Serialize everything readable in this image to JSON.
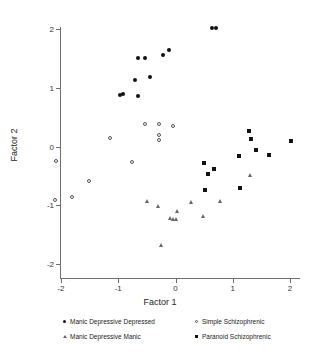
{
  "chart_data": {
    "type": "scatter",
    "title": "",
    "xlabel": "Factor 1",
    "ylabel": "Factor 2",
    "xlim": [
      -2.2,
      2.2
    ],
    "ylim": [
      -2.2,
      2.2
    ],
    "xticks": [
      "-2",
      "-1",
      "0",
      "1",
      "2"
    ],
    "xtick_values": [
      -2,
      -1,
      0,
      1,
      2
    ],
    "yticks": [
      "-2",
      "-1",
      "0",
      "1",
      "2"
    ],
    "ytick_values": [
      -2,
      -1,
      0,
      1,
      2
    ],
    "grid": false,
    "legend_position": "below",
    "series": [
      {
        "name": "Manic Depressive Depressed",
        "marker": "filled-circle",
        "color": "#111111",
        "points": [
          [
            -0.97,
            0.88
          ],
          [
            -0.92,
            0.9
          ],
          [
            -0.7,
            1.13
          ],
          [
            -0.66,
            0.86
          ],
          [
            -0.66,
            1.5
          ],
          [
            -0.53,
            1.5
          ],
          [
            -0.44,
            1.19
          ],
          [
            -0.21,
            1.55
          ],
          [
            -0.11,
            1.64
          ],
          [
            0.64,
            2.01
          ],
          [
            0.71,
            2.01
          ]
        ]
      },
      {
        "name": "Manic Depressive Manic",
        "marker": "open-triangle",
        "color": "#666666",
        "points": [
          [
            -0.5,
            -0.93
          ],
          [
            -0.3,
            -1.01
          ],
          [
            -0.09,
            -1.21
          ],
          [
            -0.05,
            -1.23
          ],
          [
            0.0,
            -1.23
          ],
          [
            0.02,
            -1.09
          ],
          [
            0.27,
            -0.94
          ],
          [
            0.48,
            -1.19
          ],
          [
            0.78,
            -0.92
          ],
          [
            1.3,
            -0.48
          ],
          [
            -0.25,
            -1.67
          ]
        ]
      },
      {
        "name": "Simple Schizophrenic",
        "marker": "open-circle",
        "color": "#555555",
        "points": [
          [
            -2.09,
            -0.25
          ],
          [
            -2.1,
            -0.91
          ],
          [
            -1.81,
            -0.86
          ],
          [
            -1.51,
            -0.58
          ],
          [
            -1.15,
            0.14
          ],
          [
            -0.76,
            -0.26
          ],
          [
            -0.54,
            0.39
          ],
          [
            -0.29,
            0.39
          ],
          [
            -0.05,
            0.35
          ],
          [
            -0.29,
            0.19
          ],
          [
            -0.29,
            0.11
          ]
        ]
      },
      {
        "name": "Paranoid Schizophrenic",
        "marker": "filled-square",
        "color": "#111111",
        "points": [
          [
            0.5,
            -0.28
          ],
          [
            0.56,
            -0.46
          ],
          [
            0.52,
            -0.74
          ],
          [
            0.67,
            -0.39
          ],
          [
            1.11,
            -0.17
          ],
          [
            1.13,
            -0.71
          ],
          [
            1.29,
            0.27
          ],
          [
            1.32,
            0.12
          ],
          [
            1.41,
            -0.06
          ],
          [
            1.64,
            -0.14
          ],
          [
            2.01,
            0.1
          ]
        ]
      }
    ]
  },
  "legend": {
    "entries": [
      {
        "label": "Manic Depressive Depressed",
        "marker": "filled-circle"
      },
      {
        "label": "Manic Depressive Manic",
        "marker": "open-triangle"
      },
      {
        "label": "Simple Schizophrenic",
        "marker": "open-circle"
      },
      {
        "label": "Paranoid Schizophrenic",
        "marker": "filled-square"
      }
    ]
  }
}
